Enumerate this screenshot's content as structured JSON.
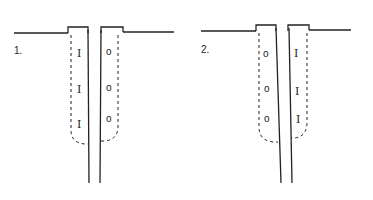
{
  "figures": [
    {
      "label": "1.",
      "left_marks": [
        "I",
        "I",
        "I"
      ],
      "right_marks": [
        "o",
        "o",
        "o"
      ],
      "left_mark_type": "bar-stitch",
      "right_mark_type": "circle"
    },
    {
      "label": "2.",
      "left_marks": [
        "o",
        "o",
        "o"
      ],
      "right_marks": [
        "I",
        "I",
        "I"
      ],
      "left_mark_type": "circle",
      "right_mark_type": "bar-stitch"
    }
  ],
  "colors": {
    "ink": "#222222",
    "background": "#ffffff"
  }
}
